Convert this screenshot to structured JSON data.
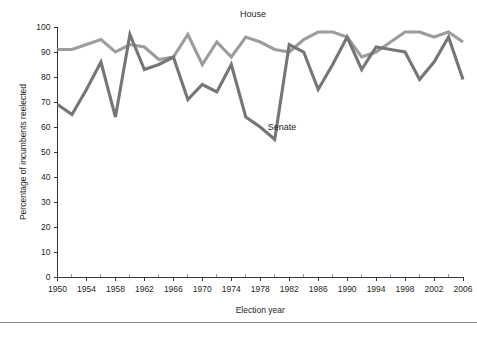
{
  "figure": {
    "width": 477,
    "height": 338,
    "background": "#ffffff",
    "footer_rule_y": 322,
    "footer_rule_color": "#8c8c8c"
  },
  "chart_data": {
    "type": "line",
    "title": "",
    "xlabel": "Election year",
    "ylabel": "Percentage of incumbents reelected",
    "xlim": [
      1950,
      2006
    ],
    "ylim": [
      0,
      100
    ],
    "grid": false,
    "legend_position": "inline-annotation",
    "x_major_ticks": [
      1950,
      1954,
      1958,
      1962,
      1966,
      1970,
      1974,
      1978,
      1982,
      1986,
      1990,
      1994,
      1998,
      2002,
      2006
    ],
    "x_tick_labels": [
      "1950",
      "1954",
      "1958",
      "1962",
      "1966",
      "1970",
      "1974",
      "1978",
      "1982",
      "1986",
      "1990",
      "1994",
      "1998",
      "2002",
      "2006"
    ],
    "x_minor_ticks": [
      1952,
      1956,
      1960,
      1964,
      1968,
      1972,
      1976,
      1980,
      1984,
      1988,
      1992,
      1996,
      2000,
      2004
    ],
    "y_ticks": [
      0,
      10,
      20,
      30,
      40,
      50,
      60,
      70,
      80,
      90,
      100
    ],
    "y_tick_labels": [
      "0",
      "10",
      "20",
      "30",
      "40",
      "50",
      "60",
      "70",
      "80",
      "90",
      "100"
    ],
    "x": [
      1950,
      1952,
      1954,
      1956,
      1958,
      1960,
      1962,
      1964,
      1966,
      1968,
      1970,
      1972,
      1974,
      1976,
      1978,
      1980,
      1982,
      1984,
      1986,
      1988,
      1990,
      1992,
      1994,
      1996,
      1998,
      2000,
      2002,
      2004,
      2006
    ],
    "series": [
      {
        "name": "House",
        "label": "House",
        "color": "#9d9d9d",
        "label_x": 1977,
        "label_y": 104,
        "values": [
          91,
          91,
          93,
          95,
          90,
          93,
          92,
          87,
          88,
          97,
          85,
          94,
          88,
          96,
          94,
          91,
          90,
          95,
          98,
          98,
          96,
          88,
          90,
          94,
          98,
          98,
          96,
          98,
          94
        ]
      },
      {
        "name": "Senate",
        "label": "Senate",
        "color": "#767676",
        "label_x": 1981,
        "label_y": 59,
        "values": [
          69,
          65,
          75,
          86,
          64,
          97,
          83,
          85,
          88,
          71,
          77,
          74,
          85,
          64,
          60,
          55,
          93,
          90,
          75,
          85,
          96,
          83,
          92,
          91,
          90,
          79,
          86,
          96,
          79
        ]
      }
    ]
  }
}
